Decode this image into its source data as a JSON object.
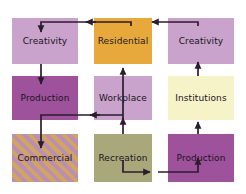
{
  "diagram": {
    "background": "#ffffff",
    "line_color": "#2b1d2e",
    "nodes": [
      {
        "id": "creativity_tl",
        "label": "Creativity",
        "fill": "#c9a3cb",
        "style": "solid",
        "col": 1,
        "row": 1,
        "x": 12,
        "y": 18,
        "w": 66,
        "h": 46
      },
      {
        "id": "residential",
        "label": "Residential",
        "fill": "#e8a93c",
        "style": "solid",
        "col": 2,
        "row": 1,
        "x": 94,
        "y": 18,
        "w": 58,
        "h": 46
      },
      {
        "id": "creativity_tr",
        "label": "Creativity",
        "fill": "#c9a3cb",
        "style": "solid",
        "col": 3,
        "row": 1,
        "x": 168,
        "y": 18,
        "w": 66,
        "h": 46
      },
      {
        "id": "production_ml",
        "label": "Production",
        "fill": "#9e529b",
        "style": "solid",
        "col": 1,
        "row": 2,
        "x": 12,
        "y": 76,
        "w": 66,
        "h": 44
      },
      {
        "id": "workplace",
        "label": "Workplace",
        "fill": "#c9a3cb",
        "style": "solid",
        "col": 2,
        "row": 2,
        "x": 94,
        "y": 76,
        "w": 58,
        "h": 44
      },
      {
        "id": "institutions",
        "label": "Institutions",
        "fill": "#f7f3c8",
        "style": "solid",
        "col": 3,
        "row": 2,
        "x": 168,
        "y": 76,
        "w": 66,
        "h": 44
      },
      {
        "id": "commercial",
        "label": "Commercial",
        "fill": "#b98fb3",
        "style": "diagonal-hatch",
        "col": 1,
        "row": 3,
        "x": 12,
        "y": 134,
        "w": 66,
        "h": 48
      },
      {
        "id": "recreation",
        "label": "Recreation",
        "fill": "#a9a87a",
        "style": "solid",
        "col": 2,
        "row": 3,
        "x": 94,
        "y": 134,
        "w": 58,
        "h": 48
      },
      {
        "id": "production_br",
        "label": "Production",
        "fill": "#9e529b",
        "style": "solid",
        "col": 3,
        "row": 3,
        "x": 168,
        "y": 134,
        "w": 66,
        "h": 48
      }
    ],
    "edges": [
      {
        "id": "e1",
        "from": "residential",
        "to": "creativity_tl",
        "label": ""
      },
      {
        "id": "e2",
        "from": "creativity_tr",
        "to": "residential",
        "label": ""
      },
      {
        "id": "e3",
        "from": "creativity_tl",
        "to": "production_ml",
        "label": ""
      },
      {
        "id": "e4",
        "from": "workplace",
        "to": "residential",
        "label": ""
      },
      {
        "id": "e5",
        "from": "workplace",
        "to": "commercial",
        "label": ""
      },
      {
        "id": "e6",
        "from": "recreation",
        "to": "workplace",
        "label": ""
      },
      {
        "id": "e7",
        "from": "recreation",
        "to": "production_br",
        "label": ""
      },
      {
        "id": "e8",
        "from": "production_br",
        "to": "institutions",
        "label": ""
      },
      {
        "id": "e9",
        "from": "institutions",
        "to": "creativity_tr",
        "label": ""
      }
    ]
  }
}
